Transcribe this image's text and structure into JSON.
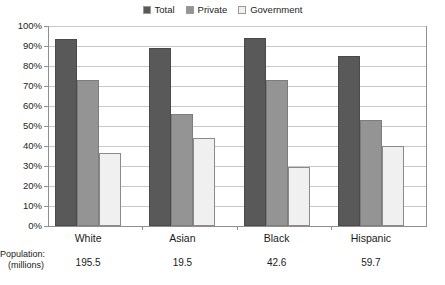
{
  "chart_data": {
    "type": "bar",
    "title": "",
    "xlabel": "",
    "ylabel": "",
    "ylim": [
      0,
      100
    ],
    "grid": true,
    "legend_position": "top-center",
    "categories": [
      "White",
      "Asian",
      "Black",
      "Hispanic"
    ],
    "ytick_labels": [
      "100%",
      "90%",
      "80%",
      "70%",
      "60%",
      "50%",
      "40%",
      "30%",
      "20%",
      "10%",
      "0%"
    ],
    "ytick_values": [
      100,
      90,
      80,
      70,
      60,
      50,
      40,
      30,
      20,
      10,
      0
    ],
    "series": [
      {
        "name": "Total",
        "color": "#595959",
        "values": [
          93.5,
          89.0,
          94.0,
          85.0
        ]
      },
      {
        "name": "Private",
        "color": "#949494",
        "values": [
          73.0,
          56.0,
          73.0,
          53.0
        ]
      },
      {
        "name": "Government",
        "color": "#f0f0f0",
        "values": [
          36.5,
          44.0,
          29.5,
          40.0
        ]
      }
    ],
    "annotations": {
      "population_label_line1": "Population:",
      "population_label_line2": "(millions)",
      "population_values": [
        "195.5",
        "19.5",
        "42.6",
        "59.7"
      ]
    }
  },
  "colors": {
    "total": "#595959",
    "private": "#949494",
    "government": "#f0f0f0",
    "gridline": "#c8c8c8",
    "axis": "#8f8f8f",
    "text": "#1a1a1a",
    "background": "#ffffff"
  }
}
